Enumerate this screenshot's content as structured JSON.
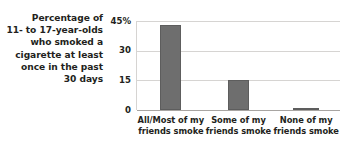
{
  "caption": {
    "lines": [
      "Percentage of",
      "11- to 17-year-olds",
      "who smoked a",
      "cigarette at least",
      "once in the past",
      "30 days"
    ]
  },
  "colors": {
    "bar": "#6e6e6e",
    "bar_edge": "#5d5d5d",
    "gridline": "#d6d4d2",
    "axis": "#a8a5a2",
    "text": "#231f20",
    "background": "#ffffff"
  },
  "chart_data": {
    "type": "bar",
    "title": "",
    "subtitle": "",
    "xlabel": "",
    "ylabel": "Percentage of 11- to 17-year-olds who smoked a cigarette at least once in the past 30 days",
    "categories": [
      "All/Most of my friends smoke",
      "Some of my friends smoke",
      "None of my friends smoke"
    ],
    "category_lines": [
      [
        "All/Most of my",
        "friends smoke"
      ],
      [
        "Some of my",
        "friends smoke"
      ],
      [
        "None of my",
        "friends smoke"
      ]
    ],
    "values": [
      43,
      15,
      1
    ],
    "ylim": [
      0,
      45
    ],
    "yticks": [
      0,
      15,
      30,
      45
    ],
    "ytick_labels": [
      "0",
      "15",
      "30",
      "45%"
    ],
    "grid": true,
    "legend": "none",
    "legend_position": "none",
    "bar_color": "#6e6e6e"
  }
}
